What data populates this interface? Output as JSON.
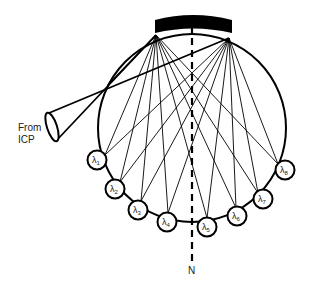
{
  "diagram": {
    "title": "",
    "source_label_line1": "From",
    "source_label_line2": "ICP",
    "axis_label": "N",
    "colors": {
      "stroke": "#000000",
      "background": "#ffffff",
      "text": "#222222"
    },
    "detectors": [
      {
        "symbol": "λ",
        "sub": "1",
        "cx": 97,
        "cy": 160
      },
      {
        "symbol": "λ",
        "sub": "2",
        "cx": 115,
        "cy": 189
      },
      {
        "symbol": "λ",
        "sub": "3",
        "cx": 138,
        "cy": 210
      },
      {
        "symbol": "λ",
        "sub": "4",
        "cx": 167,
        "cy": 222
      },
      {
        "symbol": "λ",
        "sub": "5",
        "cx": 207,
        "cy": 227
      },
      {
        "symbol": "λ",
        "sub": "6",
        "cx": 237,
        "cy": 216
      },
      {
        "symbol": "λ",
        "sub": "7",
        "cx": 263,
        "cy": 199
      },
      {
        "symbol": "λ",
        "sub": "8",
        "cx": 285,
        "cy": 170
      }
    ]
  }
}
